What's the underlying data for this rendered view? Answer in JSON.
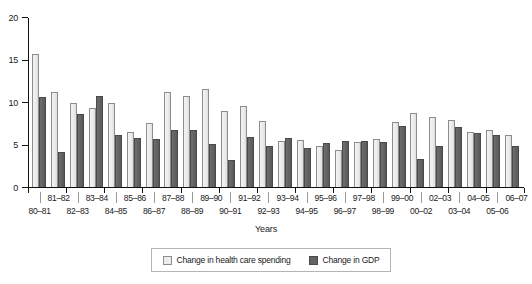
{
  "chart_data": {
    "type": "bar",
    "title": "",
    "xlabel": "Years",
    "ylabel": "",
    "ylim": [
      0,
      20
    ],
    "yticks": [
      0,
      5,
      10,
      15,
      20
    ],
    "grid": false,
    "legend_position": "bottom",
    "categories": [
      "80–81",
      "81–82",
      "82–83",
      "83–84",
      "84–85",
      "85–86",
      "86–87",
      "87–88",
      "88–89",
      "89–90",
      "90–91",
      "91–92",
      "92–93",
      "93–94",
      "94–95",
      "95–96",
      "96–97",
      "97–98",
      "98–99",
      "99–00",
      "00–02",
      "02–03",
      "03–04",
      "04–05",
      "05–06",
      "06–07"
    ],
    "series": [
      {
        "name": "Change in health care spending",
        "color": "#ececeA",
        "values": [
          15.8,
          11.3,
          10.0,
          9.3,
          9.9,
          6.5,
          7.6,
          11.2,
          10.8,
          11.6,
          9.0,
          9.6,
          7.8,
          5.5,
          5.6,
          4.8,
          4.4,
          5.3,
          5.7,
          7.7,
          8.8,
          8.3,
          7.9,
          6.5,
          6.7,
          6.2
        ]
      },
      {
        "name": "Change in GDP",
        "color": "#636363",
        "values": [
          10.7,
          4.1,
          8.6,
          10.8,
          6.1,
          5.8,
          5.7,
          6.8,
          6.8,
          5.1,
          3.2,
          5.9,
          4.9,
          5.8,
          4.6,
          5.2,
          5.5,
          5.5,
          5.3,
          7.2,
          3.3,
          4.8,
          7.1,
          6.4,
          6.2,
          4.9
        ]
      }
    ]
  },
  "axis": {
    "y_tick_labels": [
      "0",
      "5",
      "10",
      "15",
      "20"
    ],
    "x_title": "Years",
    "x_labels_top": [
      "81–82",
      "83–84",
      "85–86",
      "87–88",
      "89–90",
      "91–92",
      "93–94",
      "95–96",
      "97–98",
      "99–00",
      "02–03",
      "04–05",
      "06–07"
    ],
    "x_labels_bottom": [
      "80–81",
      "82–83",
      "84–85",
      "86–87",
      "88–89",
      "90–91",
      "92–93",
      "94–95",
      "96–97",
      "98–99",
      "00–02",
      "03–04",
      "05–06"
    ]
  },
  "legend": {
    "items": [
      {
        "label": "Change in health care spending",
        "swatch": "light-swatch-icon"
      },
      {
        "label": "Change in GDP",
        "swatch": "dark-swatch-icon"
      }
    ]
  }
}
